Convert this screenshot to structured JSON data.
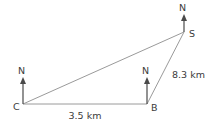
{
  "diagram": {
    "type": "bearings-triangle",
    "canvas": {
      "width": 209,
      "height": 123,
      "background": "#ffffff"
    },
    "stroke_color": "#9a9a9a",
    "text_color": "#3b3b3b",
    "arrow_color": "#4a4a4a",
    "vertices": [
      {
        "id": "C",
        "label": "C",
        "x": 23,
        "y": 104,
        "label_x": 13,
        "label_y": 110
      },
      {
        "id": "B",
        "label": "B",
        "x": 147,
        "y": 104,
        "label_x": 151,
        "label_y": 111
      },
      {
        "id": "S",
        "label": "S",
        "x": 184,
        "y": 32,
        "label_x": 189,
        "label_y": 37
      }
    ],
    "edges": [
      {
        "id": "CB",
        "from": "C",
        "to": "B",
        "x1": 23,
        "y1": 104,
        "x2": 147,
        "y2": 104
      },
      {
        "id": "CS",
        "from": "C",
        "to": "S",
        "x1": 23,
        "y1": 104,
        "x2": 184,
        "y2": 32
      },
      {
        "id": "BS",
        "from": "B",
        "to": "S",
        "x1": 147,
        "y1": 104,
        "x2": 184,
        "y2": 32
      }
    ],
    "north_arrows": [
      {
        "id": "north-at-C",
        "label": "N",
        "x": 23,
        "tail_y": 104,
        "tip_y": 77,
        "label_x": 18,
        "label_y": 74
      },
      {
        "id": "north-at-B",
        "label": "N",
        "x": 147,
        "tail_y": 104,
        "tip_y": 77,
        "label_x": 142,
        "label_y": 74
      },
      {
        "id": "north-at-S",
        "label": "N",
        "x": 184,
        "tail_y": 32,
        "tip_y": 14,
        "label_x": 179,
        "label_y": 11
      }
    ],
    "measurements": [
      {
        "id": "measure-CB",
        "edge": "CB",
        "text": "3.5 km",
        "x": 85,
        "y": 119,
        "anchor": "middle"
      },
      {
        "id": "measure-BS",
        "edge": "BS",
        "text": "8.3 km",
        "x": 172,
        "y": 78,
        "anchor": "start"
      }
    ]
  }
}
